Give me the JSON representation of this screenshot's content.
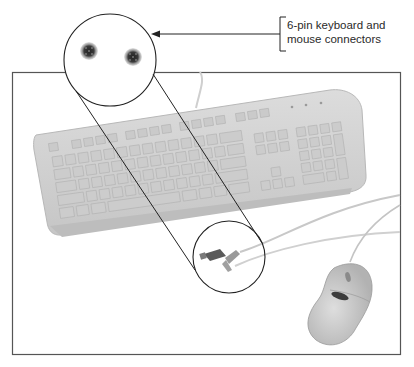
{
  "figure": {
    "type": "labeled photo diagram",
    "callout": {
      "label_line1": "6-pin keyboard and",
      "label_line2": "mouse connectors",
      "target": "magnified-connector-ends"
    },
    "elements": {
      "photo_frame": "photograph of keyboard, mouse and cables",
      "magnifier_circle": "enlarged view of two 6-pin mini-DIN connector faces",
      "source_circle": "two PS/2 plugs at cable ends",
      "mouse_logo": "BELKIN"
    },
    "colors": {
      "line": "#222222",
      "frame": "#555555",
      "keyboard": "#d4d4d4",
      "keys": "#c8c8c8",
      "mouse": "#c4c4c4",
      "connector": "#3a3a3a"
    }
  }
}
